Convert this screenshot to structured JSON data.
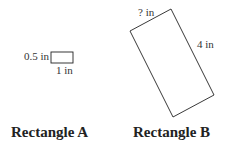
{
  "figure": {
    "rect_a": {
      "title": "Rectangle A",
      "height_label": "0.5 in",
      "width_label": "1 in"
    },
    "rect_b": {
      "title": "Rectangle B",
      "short_side_label": "? in",
      "long_side_label": "4 in"
    }
  }
}
